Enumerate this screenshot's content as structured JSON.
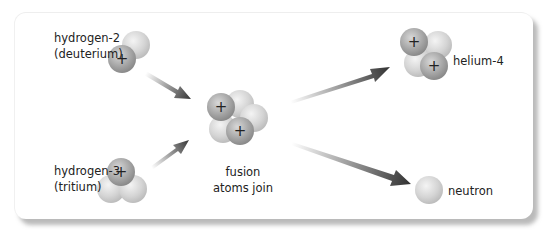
{
  "diagram": {
    "inputs": [
      {
        "name": "hydrogen-2",
        "alias": "(deuterium)",
        "protons": 1,
        "neutrons": 1
      },
      {
        "name": "hydrogen-3",
        "alias": "(tritium)",
        "protons": 1,
        "neutrons": 2
      }
    ],
    "process": {
      "line1": "fusion",
      "line2": "atoms join",
      "protons": 2,
      "neutrons": 3
    },
    "outputs": [
      {
        "name": "helium-4",
        "protons": 2,
        "neutrons": 2
      },
      {
        "name": "neutron",
        "protons": 0,
        "neutrons": 1
      }
    ],
    "proton_symbol": "+",
    "colors": {
      "proton": "#a9a9a9",
      "neutron": "#d6d6d6",
      "arrow_dark": "#3a3a3a",
      "arrow_light": "#e6e6e6",
      "shadow": "#8c8c8c"
    }
  }
}
